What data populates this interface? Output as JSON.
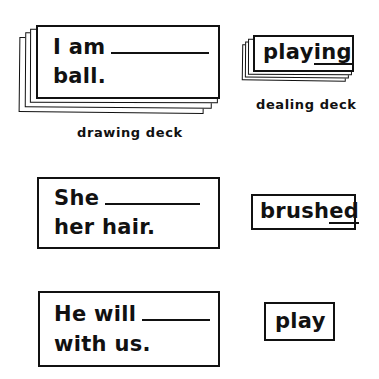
{
  "drawing_deck": {
    "label": "drawing deck",
    "top_card": {
      "line1_text": "I am",
      "line2_text": "ball."
    }
  },
  "dealing_deck": {
    "label": "dealing deck",
    "top_card": {
      "stem": "play",
      "suffix": "ing"
    }
  },
  "example_1": {
    "sentence_card": {
      "line1_text": "She",
      "line2_text": "her hair."
    },
    "word_card": {
      "stem": "brush",
      "suffix": "ed"
    }
  },
  "example_2": {
    "sentence_card": {
      "line1_text": "He will",
      "line2_text": "with us."
    },
    "word_card": {
      "word": "play"
    }
  },
  "colors": {
    "ink": "#111111",
    "paper": "#ffffff"
  }
}
